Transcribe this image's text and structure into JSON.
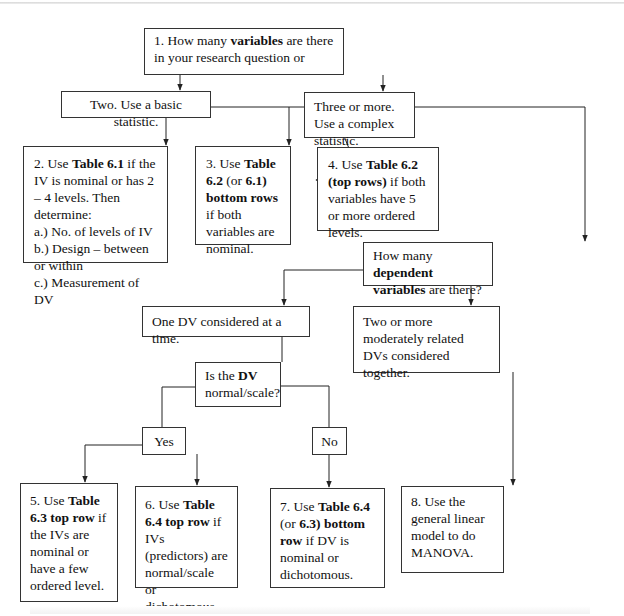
{
  "diagram": {
    "type": "flowchart",
    "nodes": [
      {
        "id": "q1",
        "parts": [
          {
            "t": "1.  How many "
          },
          {
            "t": "variables",
            "b": true
          },
          {
            "t": " are there in your research question or"
          }
        ]
      },
      {
        "id": "two",
        "parts": [
          {
            "t": "Two. Use a basic statistic."
          }
        ]
      },
      {
        "id": "three",
        "parts": [
          {
            "t": "Three or more. Use a complex statistic."
          }
        ]
      },
      {
        "id": "n2",
        "parts": [
          {
            "t": "2.  Use "
          },
          {
            "t": "Table 6.1",
            "b": true
          },
          {
            "t": " if the IV is nominal or has 2 – 4 levels.  Then determine:"
          },
          {
            "br": true
          },
          {
            "t": "a.) No. of levels of IV"
          },
          {
            "br": true
          },
          {
            "t": "b.) Design – between or within"
          },
          {
            "br": true
          },
          {
            "t": "c.) Measurement of DV"
          }
        ]
      },
      {
        "id": "n3",
        "parts": [
          {
            "t": "3.  Use "
          },
          {
            "t": "Table 6.2",
            "b": true
          },
          {
            "t": " (or "
          },
          {
            "t": "6.1)",
            "b": true
          },
          {
            "t": " "
          },
          {
            "t": "bottom rows",
            "b": true
          },
          {
            "t": " if both variables are nominal."
          }
        ]
      },
      {
        "id": "n4",
        "parts": [
          {
            "t": "4.  Use "
          },
          {
            "t": "Table 6.2",
            "b": true
          },
          {
            "t": " "
          },
          {
            "t": "(top rows)",
            "b": true
          },
          {
            "t": " if both variables have 5 or more ordered levels."
          }
        ]
      },
      {
        "id": "qdv",
        "parts": [
          {
            "t": "How many "
          },
          {
            "t": "dependent variables",
            "b": true
          },
          {
            "t": " are there?"
          }
        ]
      },
      {
        "id": "one_dv",
        "parts": [
          {
            "t": "One DV considered at a time."
          }
        ]
      },
      {
        "id": "multi_dv",
        "parts": [
          {
            "t": "Two or more moderately related DVs considered together."
          }
        ]
      },
      {
        "id": "q_normal",
        "parts": [
          {
            "t": "Is the  "
          },
          {
            "t": "DV",
            "b": true
          },
          {
            "t": " normal/scale?"
          }
        ]
      },
      {
        "id": "yes",
        "parts": [
          {
            "t": "Yes"
          }
        ]
      },
      {
        "id": "no",
        "parts": [
          {
            "t": "No"
          }
        ]
      },
      {
        "id": "n5",
        "parts": [
          {
            "t": "5.  Use "
          },
          {
            "t": "Table 6.3 top row",
            "b": true
          },
          {
            "t": " if the IVs are nominal or have a few ordered level."
          }
        ]
      },
      {
        "id": "n6",
        "parts": [
          {
            "t": "6.  Use "
          },
          {
            "t": "Table 6.4 top row",
            "b": true
          },
          {
            "t": " if IVs (predictors) are normal/scale or dichotomous."
          }
        ]
      },
      {
        "id": "n7",
        "parts": [
          {
            "t": "7.  Use "
          },
          {
            "t": "Table 6.4",
            "b": true
          },
          {
            "t": " (or "
          },
          {
            "t": "6.3)",
            "b": true
          },
          {
            "t": " "
          },
          {
            "t": "bottom row",
            "b": true
          },
          {
            "t": " if DV is nominal or dichotomous."
          }
        ]
      },
      {
        "id": "n8",
        "parts": [
          {
            "t": "8.  Use the general linear model to do MANOVA."
          }
        ]
      }
    ],
    "edges": [
      {
        "from": "q1",
        "to": "two"
      },
      {
        "from": "q1",
        "to": "three"
      },
      {
        "from": "two",
        "to": "n2"
      },
      {
        "from": "two",
        "to": "n3"
      },
      {
        "from": "two",
        "to": "n4"
      },
      {
        "from": "three",
        "to": "qdv"
      },
      {
        "from": "qdv",
        "to": "one_dv"
      },
      {
        "from": "qdv",
        "to": "multi_dv"
      },
      {
        "from": "one_dv",
        "to": "q_normal"
      },
      {
        "from": "q_normal",
        "to": "yes"
      },
      {
        "from": "q_normal",
        "to": "no"
      },
      {
        "from": "yes",
        "to": "n5"
      },
      {
        "from": "yes",
        "to": "n6"
      },
      {
        "from": "no",
        "to": "n7"
      },
      {
        "from": "multi_dv",
        "to": "n8"
      }
    ],
    "colors": {
      "line": "#222222",
      "border": "#333333",
      "background": "#ffffff"
    }
  }
}
